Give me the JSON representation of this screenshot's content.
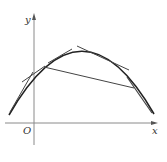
{
  "figure": {
    "type": "function-graph",
    "labels": {
      "x_axis": "x",
      "y_axis": "y",
      "origin": "O"
    },
    "curve": "concave-down parabola",
    "elements": [
      "curve",
      "tangent-line-left",
      "tangent-line-top-left",
      "tangent-line-top-right",
      "tangent-line-right",
      "secant-chord"
    ],
    "colors": {
      "axis": "#8a8a8a",
      "curve": "#222222",
      "lines": "#444444"
    }
  }
}
